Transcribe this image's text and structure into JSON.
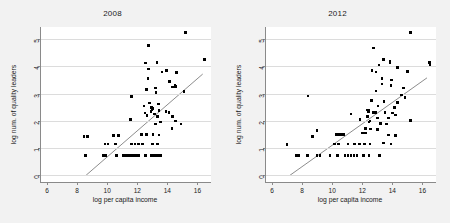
{
  "figure": {
    "background": "#f2f2f2",
    "plot_background": "#ffffff",
    "marker_color": "#000000",
    "fit_line_color": "#6e6e6e",
    "grid_color": "#dcdcdc"
  },
  "chart_data": [
    {
      "type": "scatter",
      "title": "2008",
      "xlabel": "log per capita income",
      "ylabel": "log num. of quality leaders",
      "xlim": [
        5.6,
        16.9
      ],
      "ylim": [
        -0.25,
        5.45
      ],
      "xticks": [
        6,
        8,
        10,
        12,
        14,
        16
      ],
      "yticks": [
        0,
        1,
        2,
        3,
        4,
        5
      ],
      "grid": "horizontal",
      "legend": "none",
      "fit_line": {
        "x0": 8.6,
        "y0": 0.0,
        "x1": 16.35,
        "y1": 3.72
      },
      "points": [
        [
          15.2,
          5.25
        ],
        [
          12.75,
          4.78
        ],
        [
          16.45,
          4.25
        ],
        [
          13.3,
          4.15
        ],
        [
          12.55,
          4.13
        ],
        [
          12.75,
          3.9
        ],
        [
          13.95,
          3.86
        ],
        [
          13.65,
          3.8
        ],
        [
          14.6,
          3.77
        ],
        [
          12.7,
          3.55
        ],
        [
          14.15,
          3.45
        ],
        [
          14.5,
          3.3
        ],
        [
          14.55,
          3.26
        ],
        [
          14.35,
          3.25
        ],
        [
          13.2,
          3.2
        ],
        [
          12.6,
          3.15
        ],
        [
          13.25,
          3.05
        ],
        [
          15.1,
          3.07
        ],
        [
          11.6,
          2.9
        ],
        [
          12.8,
          2.65
        ],
        [
          13.4,
          2.62
        ],
        [
          12.45,
          2.55
        ],
        [
          12.95,
          2.5
        ],
        [
          13.0,
          2.45
        ],
        [
          12.98,
          2.4
        ],
        [
          12.9,
          2.35
        ],
        [
          13.45,
          2.38
        ],
        [
          13.9,
          2.35
        ],
        [
          14.1,
          2.3
        ],
        [
          12.5,
          2.28
        ],
        [
          13.15,
          2.25
        ],
        [
          12.65,
          2.2
        ],
        [
          13.35,
          2.15
        ],
        [
          14.35,
          2.15
        ],
        [
          11.55,
          2.05
        ],
        [
          13.55,
          1.95
        ],
        [
          13.2,
          1.88
        ],
        [
          14.55,
          2.0
        ],
        [
          14.9,
          1.88
        ],
        [
          14.3,
          1.72
        ],
        [
          12.3,
          1.5
        ],
        [
          12.6,
          1.5
        ],
        [
          13.05,
          1.5
        ],
        [
          13.45,
          1.48
        ],
        [
          10.4,
          1.45
        ],
        [
          10.75,
          1.45
        ],
        [
          8.45,
          1.42
        ],
        [
          8.7,
          1.42
        ],
        [
          9.85,
          1.15
        ],
        [
          10.05,
          1.15
        ],
        [
          10.55,
          1.15
        ],
        [
          11.6,
          1.15
        ],
        [
          11.85,
          1.15
        ],
        [
          12.1,
          1.15
        ],
        [
          12.35,
          1.15
        ],
        [
          13.0,
          1.15
        ],
        [
          13.35,
          1.15
        ],
        [
          8.55,
          0.72
        ],
        [
          9.75,
          0.72
        ],
        [
          9.9,
          0.72
        ],
        [
          10.6,
          0.72
        ],
        [
          11.1,
          0.72
        ],
        [
          11.3,
          0.72
        ],
        [
          11.5,
          0.72
        ],
        [
          11.7,
          0.72
        ],
        [
          11.9,
          0.72
        ],
        [
          12.1,
          0.72
        ],
        [
          12.55,
          0.72
        ],
        [
          12.95,
          0.72
        ],
        [
          13.15,
          0.72
        ],
        [
          13.35,
          0.72
        ],
        [
          13.55,
          0.72
        ]
      ]
    },
    {
      "type": "scatter",
      "title": "2012",
      "xlabel": "log per capita income",
      "ylabel": "log num. of quality leaders",
      "xlim": [
        5.6,
        16.9
      ],
      "ylim": [
        -0.25,
        5.45
      ],
      "xticks": [
        6,
        8,
        10,
        12,
        14,
        16
      ],
      "yticks": [
        0,
        1,
        2,
        3,
        4,
        5
      ],
      "grid": "horizontal",
      "legend": "none",
      "fit_line": {
        "x0": 7.2,
        "y0": 0.0,
        "x1": 16.3,
        "y1": 3.58
      },
      "points": [
        [
          15.2,
          5.25
        ],
        [
          12.75,
          4.68
        ],
        [
          13.4,
          4.25
        ],
        [
          13.85,
          4.2
        ],
        [
          13.85,
          4.12
        ],
        [
          16.45,
          4.15
        ],
        [
          16.5,
          4.08
        ],
        [
          13.1,
          4.05
        ],
        [
          12.65,
          3.85
        ],
        [
          14.35,
          3.95
        ],
        [
          12.9,
          3.8
        ],
        [
          15.0,
          3.82
        ],
        [
          13.3,
          3.55
        ],
        [
          13.95,
          3.5
        ],
        [
          13.3,
          3.35
        ],
        [
          13.9,
          3.3
        ],
        [
          14.75,
          3.2
        ],
        [
          12.9,
          3.1
        ],
        [
          8.4,
          2.92
        ],
        [
          14.6,
          2.95
        ],
        [
          14.85,
          2.85
        ],
        [
          12.6,
          2.75
        ],
        [
          13.45,
          2.72
        ],
        [
          14.35,
          2.68
        ],
        [
          13.05,
          2.55
        ],
        [
          14.15,
          2.5
        ],
        [
          12.35,
          2.4
        ],
        [
          12.45,
          2.38
        ],
        [
          12.4,
          2.32
        ],
        [
          12.7,
          2.3
        ],
        [
          12.8,
          2.3
        ],
        [
          12.9,
          2.3
        ],
        [
          13.5,
          2.3
        ],
        [
          14.0,
          2.28
        ],
        [
          14.2,
          2.22
        ],
        [
          11.25,
          2.25
        ],
        [
          12.35,
          2.15
        ],
        [
          13.75,
          2.1
        ],
        [
          13.0,
          2.1
        ],
        [
          11.85,
          2.05
        ],
        [
          12.5,
          2.0
        ],
        [
          15.2,
          2.02
        ],
        [
          12.45,
          1.95
        ],
        [
          13.2,
          1.9
        ],
        [
          13.6,
          1.88
        ],
        [
          12.2,
          1.72
        ],
        [
          12.55,
          1.7
        ],
        [
          13.0,
          1.68
        ],
        [
          9.0,
          1.65
        ],
        [
          10.3,
          1.5
        ],
        [
          10.45,
          1.5
        ],
        [
          10.6,
          1.5
        ],
        [
          10.75,
          1.5
        ],
        [
          12.0,
          1.55
        ],
        [
          12.2,
          1.55
        ],
        [
          13.75,
          1.48
        ],
        [
          14.2,
          1.45
        ],
        [
          8.7,
          1.42
        ],
        [
          7.0,
          1.12
        ],
        [
          10.15,
          1.15
        ],
        [
          10.4,
          1.15
        ],
        [
          11.05,
          1.15
        ],
        [
          11.5,
          1.15
        ],
        [
          11.8,
          1.15
        ],
        [
          12.15,
          1.15
        ],
        [
          12.5,
          1.15
        ],
        [
          13.4,
          1.18
        ],
        [
          13.9,
          1.15
        ],
        [
          7.6,
          0.72
        ],
        [
          7.75,
          0.72
        ],
        [
          8.35,
          0.72
        ],
        [
          9.0,
          0.72
        ],
        [
          9.2,
          0.72
        ],
        [
          9.85,
          0.72
        ],
        [
          10.35,
          0.72
        ],
        [
          10.85,
          0.72
        ],
        [
          11.05,
          0.72
        ],
        [
          11.25,
          0.72
        ],
        [
          11.45,
          0.72
        ],
        [
          11.65,
          0.72
        ],
        [
          12.1,
          0.72
        ],
        [
          12.45,
          0.72
        ],
        [
          13.15,
          0.72
        ]
      ]
    }
  ]
}
